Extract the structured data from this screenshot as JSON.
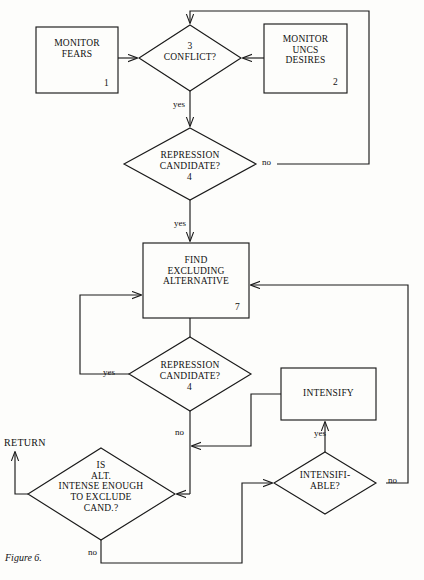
{
  "figure": {
    "caption": "Figure 6.",
    "terminal_return": "RETURN"
  },
  "nodes": {
    "monitor_fears": {
      "text": "MONITOR\nFEARS",
      "number": "1",
      "shape": "process"
    },
    "monitor_uncs_desires": {
      "text": "MONITOR\nUNCS\nDESIRES",
      "number": "2",
      "shape": "process"
    },
    "conflict": {
      "text": "3\nCONFLICT?",
      "number": "3",
      "shape": "decision"
    },
    "repression_candidate_top": {
      "text": "REPRESSION\nCANDIDATE?",
      "number": "4",
      "shape": "decision"
    },
    "find_excluding_alternative": {
      "text": "FIND\nEXCLUDING\nALTERNATIVE",
      "number": "7",
      "shape": "process"
    },
    "repression_candidate_mid": {
      "text": "REPRESSION\nCANDIDATE?",
      "number": "4",
      "shape": "decision"
    },
    "intensify": {
      "text": "INTENSIFY",
      "number": "",
      "shape": "process"
    },
    "is_alt_intense_enough": {
      "text": "IS\nALT.\nINTENSE ENOUGH\nTO EXCLUDE\nCAND.?",
      "number": "",
      "shape": "decision"
    },
    "intensifiable": {
      "text": "INTENSIFI-\nABLE?",
      "number": "",
      "shape": "decision"
    }
  },
  "edge_labels": {
    "conflict_yes": "yes",
    "repression_top_no": "no",
    "repression_top_yes": "yes",
    "repression_mid_yes": "yes",
    "repression_mid_no": "no",
    "intensifiable_yes": "yes",
    "intensifiable_no": "no",
    "is_alt_no": "no"
  },
  "colors": {
    "stroke": "#1a1a1a",
    "text": "#111111",
    "background": "#fdfdfb"
  }
}
